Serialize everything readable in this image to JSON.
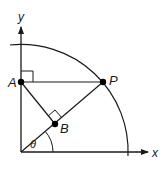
{
  "diagram": {
    "title": "",
    "colors": {
      "stroke": "#1a1a1a",
      "background": "#ffffff",
      "point": "#000000"
    },
    "axes": {
      "x_label": "x",
      "y_label": "y"
    },
    "points": {
      "A": {
        "label": "A"
      },
      "P": {
        "label": "P"
      },
      "B": {
        "label": "B"
      }
    },
    "angle_label": "θ",
    "elements": [
      "quarter circle arc centered at origin",
      "segment A-P horizontal from y-axis to arc",
      "segment O-P (ray at angle theta)",
      "segment A-B perpendicular to O-P",
      "right-angle marker at A",
      "right-angle marker at B",
      "angle theta arc at origin"
    ]
  }
}
